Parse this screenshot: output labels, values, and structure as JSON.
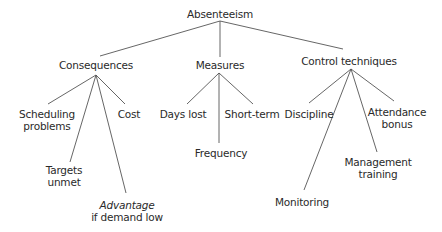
{
  "diagram": {
    "type": "tree",
    "root": {
      "id": "absenteeism",
      "label": "Absenteeism"
    },
    "nodes": [
      {
        "id": "consequences",
        "label": "Consequences",
        "parent": "absenteeism"
      },
      {
        "id": "measures",
        "label": "Measures",
        "parent": "absenteeism"
      },
      {
        "id": "control",
        "label": "Control techniques",
        "parent": "absenteeism"
      },
      {
        "id": "scheduling",
        "lines": [
          "Scheduling",
          "problems"
        ],
        "parent": "consequences"
      },
      {
        "id": "targets",
        "lines": [
          "Targets",
          "unmet"
        ],
        "parent": "consequences"
      },
      {
        "id": "advantage",
        "italic": "Advantage",
        "lines": [
          "if demand low"
        ],
        "parent": "consequences"
      },
      {
        "id": "cost",
        "label": "Cost",
        "parent": "consequences"
      },
      {
        "id": "dayslost",
        "label": "Days lost",
        "parent": "measures"
      },
      {
        "id": "frequency",
        "label": "Frequency",
        "parent": "measures"
      },
      {
        "id": "shortterm",
        "label": "Short-term",
        "parent": "measures"
      },
      {
        "id": "discipline",
        "label": "Discipline",
        "parent": "control"
      },
      {
        "id": "monitoring",
        "label": "Monitoring",
        "parent": "control"
      },
      {
        "id": "management",
        "lines": [
          "Management",
          "training"
        ],
        "parent": "control"
      },
      {
        "id": "attendance",
        "lines": [
          "Attendance",
          "bonus"
        ],
        "parent": "control"
      }
    ]
  }
}
